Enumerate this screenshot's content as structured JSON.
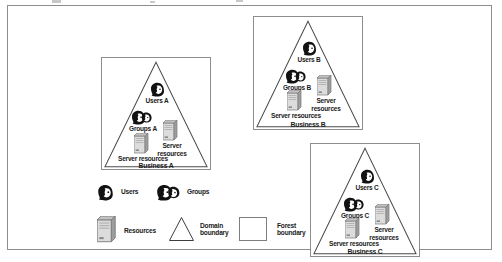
{
  "diagram": {
    "forest_boundary_label": "Forest boundary",
    "domain_boundary_label": "Domain boundary"
  },
  "domains": [
    {
      "id": "a",
      "title": "Business A",
      "users_label": "Users A",
      "groups_label": "Groups A",
      "server_left_label": "Server resources",
      "server_right_label": "Server resources",
      "icons": {
        "users": "user-head-icon",
        "groups": "group-heads-icon",
        "server": "server-tower-icon"
      }
    },
    {
      "id": "b",
      "title": "Business B",
      "users_label": "Users B",
      "groups_label": "Groups B",
      "server_left_label": "Server resources",
      "server_right_label": "Server resources",
      "icons": {
        "users": "user-head-icon",
        "groups": "group-heads-icon",
        "server": "server-tower-icon"
      }
    },
    {
      "id": "c",
      "title": "Business C",
      "users_label": "Users C",
      "groups_label": "Groups C",
      "server_left_label": "Server resources",
      "server_right_label": "Server resources",
      "icons": {
        "users": "user-head-icon",
        "groups": "group-heads-icon",
        "server": "server-tower-icon"
      }
    }
  ],
  "legend": {
    "items": [
      {
        "key": "users",
        "label": "Users",
        "icon": "user-head-icon"
      },
      {
        "key": "groups",
        "label": "Groups",
        "icon": "group-heads-icon"
      },
      {
        "key": "resources",
        "label": "Resources",
        "icon": "server-tower-icon"
      },
      {
        "key": "domain",
        "label": "Domain boundary",
        "icon": "triangle-outline-icon"
      },
      {
        "key": "forest",
        "label": "Forest boundary",
        "icon": "square-outline-icon"
      }
    ]
  },
  "colors": {
    "border": "#8d8d8d",
    "triangle_stroke": "#4a4a4a",
    "text": "#1a1a1a",
    "server_body": "#d9d9d9",
    "server_side": "#9a9a9a",
    "icon_dark": "#121212",
    "background": "#ffffff"
  }
}
